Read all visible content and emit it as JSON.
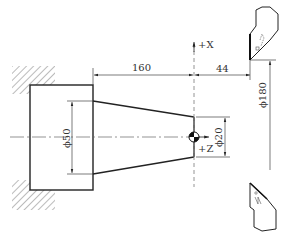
{
  "diagram": {
    "type": "CNC turning setup drawing",
    "axes": {
      "x_label": "+X",
      "z_label": "+Z"
    },
    "dimensions": {
      "length_taper": "160",
      "tool_offset": "44",
      "dia_large": "ϕ50",
      "dia_small": "ϕ20",
      "dia_tool": "ϕ180"
    },
    "elements": [
      "chuck-jaws-hatched",
      "workpiece-cylinder",
      "tapered-section",
      "centerline",
      "program-origin",
      "upper-tool",
      "lower-tool"
    ],
    "colors": {
      "line": "#222222",
      "thin_line": "#444444",
      "dash": "#777777"
    }
  }
}
